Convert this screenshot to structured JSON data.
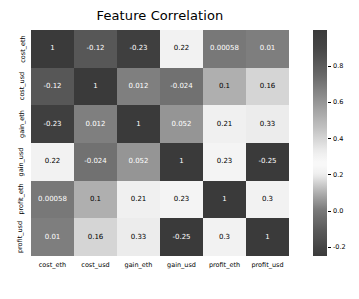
{
  "chart_data": {
    "type": "heatmap",
    "title": "Feature Correlation",
    "xlabel": "",
    "ylabel": "",
    "grid": false,
    "legend_position": "right-colorbar",
    "categories": [
      "cost_eth",
      "cost_usd",
      "gain_eth",
      "gain_usd",
      "profit_eth",
      "profit_usd"
    ],
    "x_tick_labels": [
      "cost_eth",
      "cost_usd",
      "gain_eth",
      "gain_usd",
      "profit_eth",
      "profit_usd"
    ],
    "y_tick_labels": [
      "cost_eth",
      "cost_usd",
      "gain_eth",
      "gain_usd",
      "profit_eth",
      "profit_usd"
    ],
    "values": [
      [
        1,
        -0.12,
        -0.23,
        0.22,
        0.00058,
        0.01
      ],
      [
        -0.12,
        1,
        0.012,
        -0.024,
        0.1,
        0.16
      ],
      [
        -0.23,
        0.012,
        1,
        0.052,
        0.21,
        0.33
      ],
      [
        0.22,
        -0.024,
        0.052,
        1,
        0.23,
        -0.25
      ],
      [
        0.00058,
        0.1,
        0.21,
        0.23,
        1,
        0.3
      ],
      [
        0.01,
        0.16,
        0.33,
        -0.25,
        0.3,
        1
      ]
    ],
    "cell_labels": [
      [
        "1",
        "-0.12",
        "-0.23",
        "0.22",
        "0.00058",
        "0.01"
      ],
      [
        "-0.12",
        "1",
        "0.012",
        "-0.024",
        "0.1",
        "0.16"
      ],
      [
        "-0.23",
        "0.012",
        "1",
        "0.052",
        "0.21",
        "0.33"
      ],
      [
        "0.22",
        "-0.024",
        "0.052",
        "1",
        "0.23",
        "-0.25"
      ],
      [
        "0.00058",
        "0.1",
        "0.21",
        "0.23",
        "1",
        "0.3"
      ],
      [
        "0.01",
        "0.16",
        "0.33",
        "-0.25",
        "0.3",
        "1"
      ]
    ],
    "colorbar": {
      "ticks": [
        0.8,
        0.6,
        0.4,
        0.2,
        0.0,
        -0.2
      ],
      "tick_labels": [
        "0.8",
        "0.6",
        "0.4",
        "0.2",
        "0.0",
        "-0.2"
      ],
      "vmin": -0.25,
      "vmax": 1.0,
      "colormap": "grayscale-diverging"
    }
  },
  "colors": {
    "background": "#ffffff",
    "text": "#000000",
    "cell_text_light": "#ffffff",
    "cell_text_dark": "#000000"
  }
}
